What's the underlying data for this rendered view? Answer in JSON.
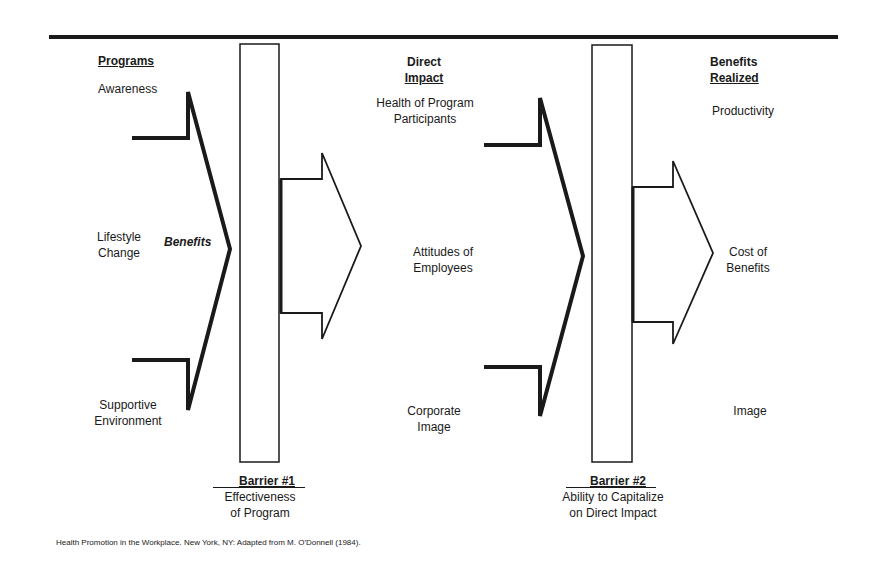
{
  "columns": {
    "programs": {
      "header": "Programs",
      "items": [
        "Awareness",
        "Lifestyle Change",
        "Supportive Environment"
      ]
    },
    "direct_impact": {
      "header_line1": "Direct",
      "header_line2": "Impact",
      "items": [
        "Health of Program Participants",
        "Attitudes of Employees",
        "Corporate Image"
      ]
    },
    "benefits_realized": {
      "header_line1": "Benefits",
      "header_line2": "Realized",
      "items": [
        "Productivity",
        "Cost of Benefits",
        "Image"
      ]
    }
  },
  "labels": {
    "arrow1_label": "Benefits",
    "awareness": "Awareness",
    "lifestyle_l1": "Lifestyle",
    "lifestyle_l2": "Change",
    "supportive_l1": "Supportive",
    "supportive_l2": "Environment",
    "health_l1": "Health of Program",
    "health_l2": "Participants",
    "attitudes_l1": "Attitudes of",
    "attitudes_l2": "Employees",
    "corporate_l1": "Corporate",
    "corporate_l2": "Image",
    "productivity": "Productivity",
    "cost_l1": "Cost of",
    "cost_l2": "Benefits",
    "image": "Image"
  },
  "barriers": [
    {
      "title": "Barrier #1",
      "desc_l1": "Effectiveness",
      "desc_l2": "of Program"
    },
    {
      "title": "Barrier #2",
      "desc_l1": "Ability to Capitalize",
      "desc_l2": "on Direct Impact"
    }
  ],
  "caption": "Health Promotion in the Workplace.  New York, NY:  Adapted from M. O'Donnell (1984).",
  "colors": {
    "ink": "#1a1a1a",
    "background": "#ffffff"
  }
}
